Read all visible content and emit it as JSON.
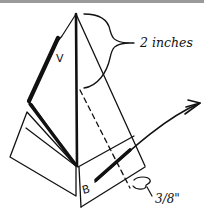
{
  "figure": {
    "type": "folding-diagram",
    "labels": {
      "height_measure": "2 inches",
      "flap_measure": "3/8\"",
      "letter_v": "V",
      "letter_b": "B"
    },
    "colors": {
      "stroke": "#111111",
      "background": "#ffffff",
      "top_border": "#9a9a9a"
    }
  }
}
